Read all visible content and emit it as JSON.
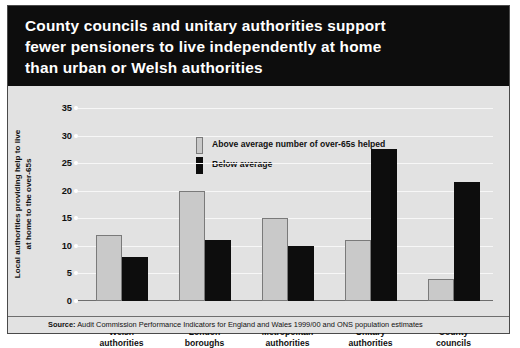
{
  "title": "County councils and unitary authorities support\nfewer pensioners to live independently at home\nthan urban or Welsh authorities",
  "source": {
    "prefix": "Source:",
    "text": " Audit Commission Performance Indicators for England and Wales 1999/00 and ONS population estimates"
  },
  "colors": {
    "banner": "#0d0d0d",
    "plot_background": "#e2e2e2",
    "gridline": "#f7f7f7",
    "above_average": "#c9c9c9",
    "below_average": "#0d0d0d",
    "axis": "#6e6e6e"
  },
  "chart_data": {
    "type": "bar",
    "title": "County councils and unitary authorities support fewer pensioners to live independently at home than urban or Welsh authorities",
    "xlabel": "",
    "ylabel": "Local authorities providing help to live\nat home to the over-65s",
    "ylim": [
      0,
      35
    ],
    "ytick_values": [
      0,
      5,
      10,
      15,
      20,
      25,
      30,
      35
    ],
    "ytick_labels": [
      "0",
      "5",
      "10",
      "15",
      "20",
      "25",
      "30",
      "35"
    ],
    "grid": true,
    "legend_position": "upper left inside",
    "categories": [
      "Welsh\nauthorities",
      "London\nboroughs",
      "Metropolitan\nauthorities",
      "Unitary\nauthorities",
      "County\ncouncils"
    ],
    "series": [
      {
        "name": "Above average number of over-65s helped",
        "color": "#c9c9c9",
        "values": [
          12,
          20,
          15,
          11,
          4
        ]
      },
      {
        "name": "Below average",
        "color": "#0d0d0d",
        "values": [
          8,
          11,
          10,
          27.5,
          21.5
        ]
      }
    ]
  }
}
